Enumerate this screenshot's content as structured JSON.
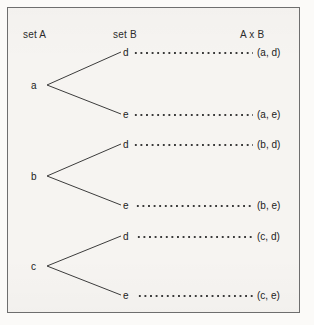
{
  "figure": {
    "type": "tree-diagram",
    "headers": {
      "left": "set A",
      "middle": "set B",
      "right": "A x B"
    },
    "set_a": [
      "a",
      "b",
      "c"
    ],
    "set_b": [
      "d",
      "e"
    ],
    "branches": [
      {
        "from": "a",
        "to": "d",
        "pair": "(a, d)"
      },
      {
        "from": "a",
        "to": "e",
        "pair": "(a, e)"
      },
      {
        "from": "b",
        "to": "d",
        "pair": "(b, d)"
      },
      {
        "from": "b",
        "to": "e",
        "pair": "(b, e)"
      },
      {
        "from": "c",
        "to": "d",
        "pair": "(c, d)"
      },
      {
        "from": "c",
        "to": "e",
        "pair": "(c, e)"
      }
    ],
    "colors": {
      "paper": "#f6f4f1",
      "ink": "#222222",
      "rule": "#6e6e6e",
      "line": "#3c3c3c"
    }
  }
}
